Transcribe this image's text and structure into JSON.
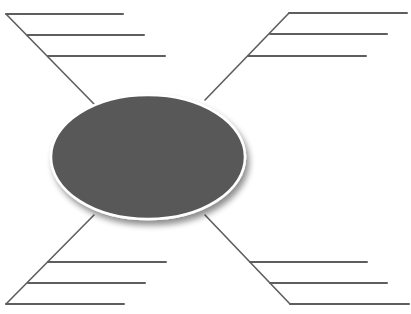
{
  "diagram": {
    "type": "spider-map",
    "width": 411,
    "height": 314,
    "colors": {
      "background": "#ffffff",
      "line": "#5e5e5e",
      "ellipse_fill": "#585858",
      "ellipse_border": "#ffffff",
      "shadow": "#000000"
    },
    "center": {
      "label": "",
      "cx": 148,
      "cy": 157,
      "rx": 97,
      "ry": 62
    },
    "branches": [
      {
        "id": "top-left",
        "label": "",
        "leg": {
          "x1": 94,
          "y1": 104,
          "x2": 6,
          "y2": 14
        },
        "lines": [
          {
            "x1": 6,
            "y1": 14,
            "x2": 123,
            "y2": 14,
            "text": ""
          },
          {
            "x1": 27,
            "y1": 35,
            "x2": 144,
            "y2": 35,
            "text": ""
          },
          {
            "x1": 48,
            "y1": 56,
            "x2": 165,
            "y2": 56,
            "text": ""
          }
        ]
      },
      {
        "id": "top-right",
        "label": "",
        "leg": {
          "x1": 205,
          "y1": 100,
          "x2": 289,
          "y2": 13
        },
        "lines": [
          {
            "x1": 289,
            "y1": 13,
            "x2": 407,
            "y2": 13,
            "text": ""
          },
          {
            "x1": 270,
            "y1": 34,
            "x2": 387,
            "y2": 34,
            "text": ""
          },
          {
            "x1": 248,
            "y1": 56,
            "x2": 366,
            "y2": 56,
            "text": ""
          }
        ]
      },
      {
        "id": "bottom-left",
        "label": "",
        "leg": {
          "x1": 94,
          "y1": 215,
          "x2": 6,
          "y2": 304
        },
        "lines": [
          {
            "x1": 48,
            "y1": 262,
            "x2": 166,
            "y2": 262,
            "text": ""
          },
          {
            "x1": 28,
            "y1": 283,
            "x2": 145,
            "y2": 283,
            "text": ""
          },
          {
            "x1": 6,
            "y1": 304,
            "x2": 124,
            "y2": 304,
            "text": ""
          }
        ]
      },
      {
        "id": "bottom-right",
        "label": "",
        "leg": {
          "x1": 205,
          "y1": 215,
          "x2": 290,
          "y2": 304
        },
        "lines": [
          {
            "x1": 250,
            "y1": 262,
            "x2": 367,
            "y2": 262,
            "text": ""
          },
          {
            "x1": 270,
            "y1": 283,
            "x2": 387,
            "y2": 283,
            "text": ""
          },
          {
            "x1": 290,
            "y1": 304,
            "x2": 409,
            "y2": 304,
            "text": ""
          }
        ]
      }
    ]
  }
}
